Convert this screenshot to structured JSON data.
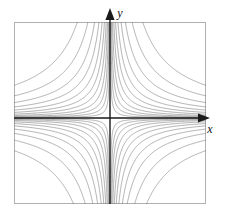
{
  "figure": {
    "title": "",
    "background_color": "#ffffff"
  },
  "axes": {
    "x_label": "x",
    "y_label": "y",
    "axis_color": "#1a1a1a",
    "frame_color": "#b0b0b0",
    "origin_px": {
      "x": 110,
      "y": 118
    },
    "frame_px": {
      "left": 14,
      "top": 22,
      "right": 206,
      "bottom": 204
    },
    "x_arrow": "arrow-right",
    "y_arrow": "arrow-up"
  },
  "chart_data": {
    "type": "line",
    "title": "",
    "subtitle": "",
    "xlabel": "x",
    "ylabel": "y",
    "xlim": [
      -1,
      1
    ],
    "ylim": [
      -1,
      1
    ],
    "grid": false,
    "legend": false,
    "legend_position": "none",
    "plot_kind": "contour",
    "function": "xy = c",
    "contour_color": "#7a7a7a",
    "contour_width": 0.6,
    "levels_positive": [
      0.004,
      0.009,
      0.016,
      0.026,
      0.04,
      0.058,
      0.082,
      0.115,
      0.16,
      0.23,
      0.34
    ],
    "levels_negative": [
      -0.004,
      -0.009,
      -0.016,
      -0.026,
      -0.04,
      -0.058,
      -0.082,
      -0.115,
      -0.16,
      -0.23,
      -0.34
    ],
    "quadrants": [
      {
        "name": "quadrant-I",
        "sign": "positive",
        "curve_count": 11
      },
      {
        "name": "quadrant-II",
        "sign": "negative",
        "curve_count": 11
      },
      {
        "name": "quadrant-III",
        "sign": "positive",
        "curve_count": 11
      },
      {
        "name": "quadrant-IV",
        "sign": "negative",
        "curve_count": 11
      }
    ],
    "series": [
      {
        "name": "xy = 0.004",
        "values": [
          0.004
        ]
      },
      {
        "name": "xy = 0.009",
        "values": [
          0.009
        ]
      },
      {
        "name": "xy = 0.016",
        "values": [
          0.016
        ]
      },
      {
        "name": "xy = 0.026",
        "values": [
          0.026
        ]
      },
      {
        "name": "xy = 0.04",
        "values": [
          0.04
        ]
      },
      {
        "name": "xy = 0.058",
        "values": [
          0.058
        ]
      },
      {
        "name": "xy = 0.082",
        "values": [
          0.082
        ]
      },
      {
        "name": "xy = 0.115",
        "values": [
          0.115
        ]
      },
      {
        "name": "xy = 0.16",
        "values": [
          0.16
        ]
      },
      {
        "name": "xy = 0.23",
        "values": [
          0.23
        ]
      },
      {
        "name": "xy = 0.34",
        "values": [
          0.34
        ]
      }
    ]
  }
}
